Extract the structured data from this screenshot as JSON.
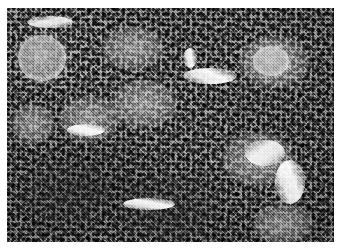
{
  "figure": {
    "kind": "light-microscopy-photomicrograph",
    "stain_appearance": "grayscale / black-and-white halftone",
    "caption": "",
    "plate": {
      "x": 7,
      "y": 8,
      "width": 327,
      "height": 234,
      "background_color": "#8e8e8e",
      "border": "none",
      "page_background": "#ffffff"
    },
    "tone": {
      "darkest": "#1e1e1e",
      "mid": "#8e8e8e",
      "lightest": "#ffffff",
      "overall": "medium-gray, high-frequency speckle"
    },
    "texture": {
      "description": "dense uniform field of small dark round nuclei on a pale interstitial matrix",
      "nucleus_diameter_px": 2,
      "density": "high"
    },
    "features": [
      {
        "name": "round-vessel-upper-left",
        "type": "vessel",
        "x": 11,
        "y": 27,
        "width": 48,
        "height": 46,
        "note": "prominent circular profile with bright rim and pale lumen"
      },
      {
        "name": "pale-zone-upper-center",
        "type": "pale",
        "x": 95,
        "y": 18,
        "width": 62,
        "height": 44
      },
      {
        "name": "pale-zone-upper-right",
        "type": "pale",
        "x": 232,
        "y": 28,
        "width": 70,
        "height": 52
      },
      {
        "name": "ring-structure-upper-right",
        "type": "vessel",
        "x": 246,
        "y": 38,
        "width": 36,
        "height": 30
      },
      {
        "name": "pale-zone-center",
        "type": "pale",
        "x": 104,
        "y": 72,
        "width": 66,
        "height": 48
      },
      {
        "name": "pale-follicle-center-left",
        "type": "pale",
        "x": 52,
        "y": 88,
        "width": 60,
        "height": 46
      },
      {
        "name": "sinusoid-center-right",
        "type": "sinus",
        "x": 176,
        "y": 60,
        "width": 54,
        "height": 16,
        "angle": "28deg"
      },
      {
        "name": "bright-vessel-mid-right",
        "type": "sinus",
        "x": 238,
        "y": 132,
        "width": 40,
        "height": 26,
        "angle": "-35deg"
      },
      {
        "name": "pale-zone-mid-right",
        "type": "pale",
        "x": 215,
        "y": 124,
        "width": 72,
        "height": 54
      },
      {
        "name": "sinusoid-lower-right",
        "type": "sinus",
        "x": 268,
        "y": 152,
        "width": 30,
        "height": 44,
        "angle": "70deg"
      },
      {
        "name": "dark-dense-patch-lower-left",
        "type": "dark",
        "x": 14,
        "y": 150,
        "width": 92,
        "height": 70
      },
      {
        "name": "dark-dense-patch-lower-center",
        "type": "dark",
        "x": 110,
        "y": 166,
        "width": 100,
        "height": 68
      },
      {
        "name": "pale-streak-lower-center",
        "type": "sinus",
        "x": 116,
        "y": 190,
        "width": 52,
        "height": 12,
        "angle": "10deg"
      },
      {
        "name": "pale-zone-left-edge",
        "type": "pale",
        "x": 4,
        "y": 96,
        "width": 44,
        "height": 40
      },
      {
        "name": "sinusoid-upper-left-edge",
        "type": "sinus",
        "x": 20,
        "y": 8,
        "width": 46,
        "height": 12,
        "angle": "-12deg"
      },
      {
        "name": "sinusoid-mid-left",
        "type": "sinus",
        "x": 60,
        "y": 116,
        "width": 38,
        "height": 12,
        "angle": "15deg"
      },
      {
        "name": "bright-fleck-upper-center",
        "type": "sinus",
        "x": 176,
        "y": 40,
        "width": 14,
        "height": 20,
        "angle": "80deg"
      },
      {
        "name": "pale-zone-lower-right-corner",
        "type": "pale",
        "x": 246,
        "y": 196,
        "width": 60,
        "height": 40
      }
    ]
  }
}
